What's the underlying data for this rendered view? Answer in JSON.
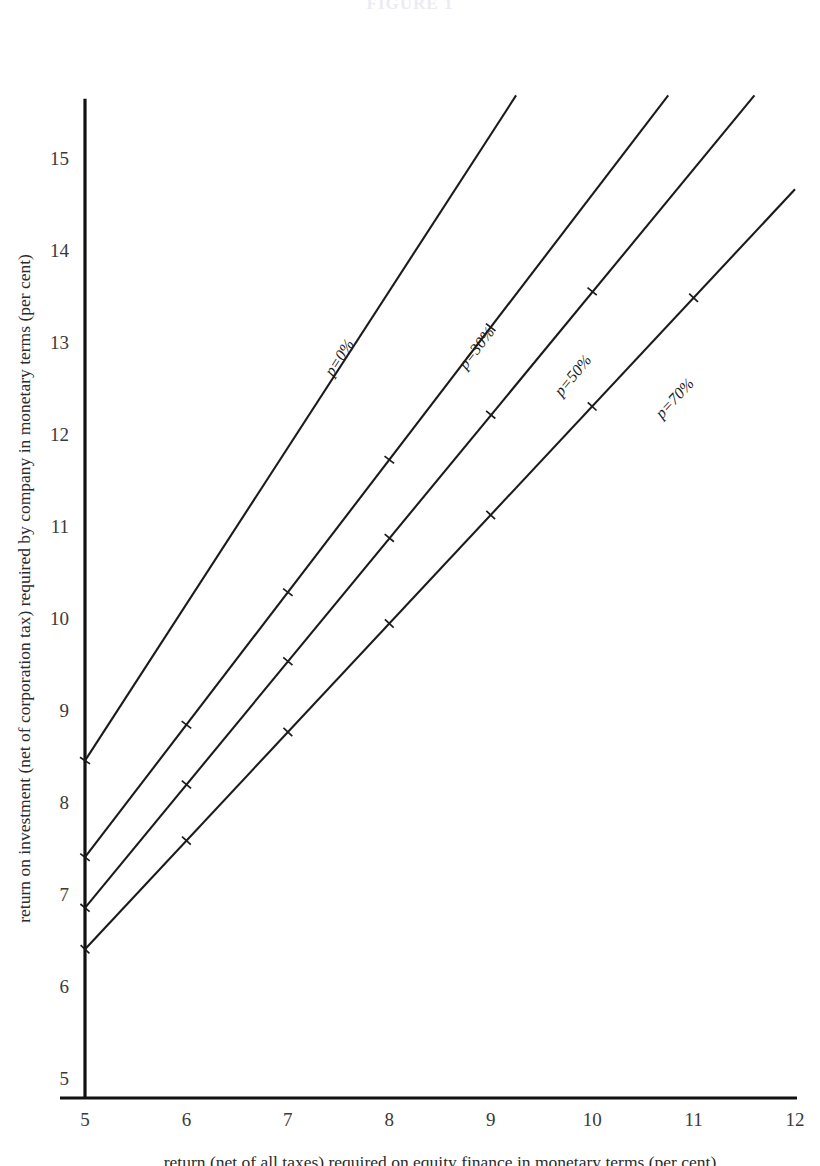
{
  "figure": {
    "title": "FIGURE 1"
  },
  "chart_data": {
    "type": "line",
    "title": "",
    "subtitle": "",
    "xlabel": "return (net of all taxes) required on equity finance in monetary terms (per cent)",
    "ylabel": "return on investment (net of corporation tax) required by company in monetary terms (per cent)",
    "xlim": [
      5,
      12
    ],
    "ylim": [
      5,
      15.6
    ],
    "xticks": [
      5,
      6,
      7,
      8,
      9,
      10,
      11,
      12
    ],
    "xticklabels": [
      "5",
      "6",
      "7",
      "8",
      "9",
      "10",
      "11",
      "12"
    ],
    "yticks": [
      5,
      6,
      7,
      8,
      9,
      10,
      11,
      12,
      13,
      14,
      15
    ],
    "yticklabels": [
      "5",
      "6",
      "7",
      "8",
      "9",
      "10",
      "11",
      "12",
      "13",
      "14",
      "15"
    ],
    "grid": false,
    "legend_position": "inline-along-line",
    "series": [
      {
        "name": "p=0%",
        "label": "p=0%",
        "intercept_at_x5": 8.45,
        "slope": 1.7,
        "x": [
          5,
          9.25
        ],
        "y": [
          8.45,
          15.68
        ],
        "markers_x": [
          5
        ],
        "markers_y": [
          8.45
        ],
        "label_at": {
          "x": 7.55,
          "y": 12.8
        }
      },
      {
        "name": "p=30%",
        "label": "p=30%",
        "intercept_at_x5": 7.4,
        "slope": 1.44,
        "x": [
          5,
          10.75
        ],
        "y": [
          7.4,
          15.68
        ],
        "markers_x": [
          5,
          6,
          7,
          8,
          9
        ],
        "markers_y": [
          7.4,
          8.84,
          10.28,
          11.72,
          13.16
        ],
        "label_at": {
          "x": 8.9,
          "y": 12.9
        }
      },
      {
        "name": "p=50%",
        "label": "p=50%",
        "intercept_at_x5": 6.85,
        "slope": 1.34,
        "x": [
          5,
          11.6
        ],
        "y": [
          6.85,
          15.68
        ],
        "markers_x": [
          5,
          6,
          7,
          8,
          9,
          10
        ],
        "markers_y": [
          6.85,
          8.19,
          9.53,
          10.87,
          12.21,
          13.55
        ],
        "label_at": {
          "x": 9.85,
          "y": 12.6
        }
      },
      {
        "name": "p=70%",
        "label": "p=70%",
        "intercept_at_x5": 6.4,
        "slope": 1.18,
        "x": [
          5,
          12.0
        ],
        "y": [
          6.4,
          14.66
        ],
        "markers_x": [
          5,
          6,
          7,
          8,
          9,
          10,
          11
        ],
        "markers_y": [
          6.4,
          7.58,
          8.76,
          9.94,
          11.12,
          12.3,
          13.48
        ],
        "label_at": {
          "x": 10.85,
          "y": 12.35
        }
      }
    ]
  },
  "colors": {
    "ink": "#1b1b1b",
    "axis": "#111111",
    "background": "#ffffff",
    "tick_text": "#3a3a3a"
  }
}
